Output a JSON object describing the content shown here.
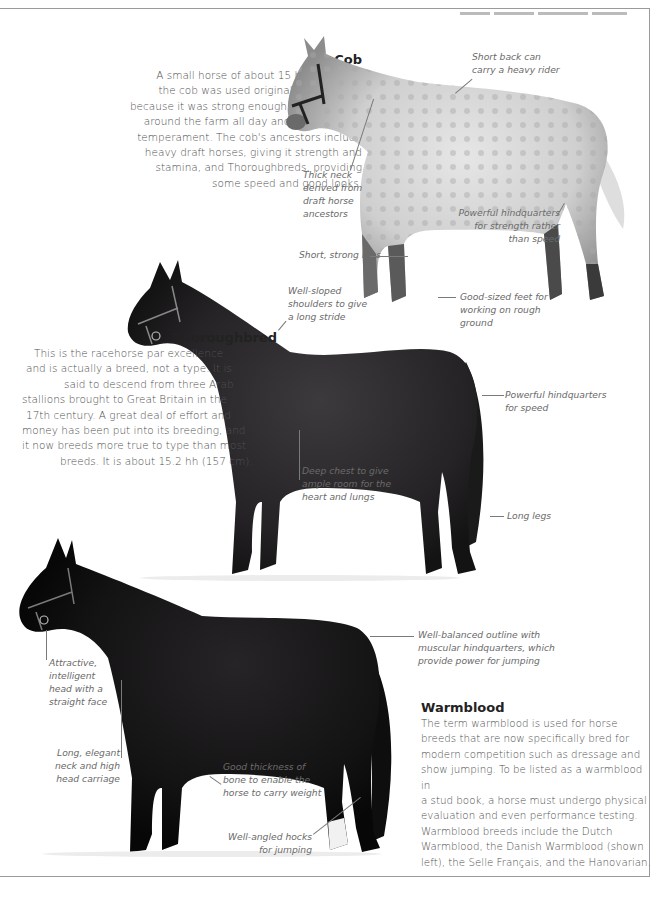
{
  "page": {
    "frame": {
      "border_color": "#9a9a9a",
      "background": "#ffffff"
    }
  },
  "breeds": {
    "cob": {
      "title": "Cob",
      "body_lines": [
        "A small horse of about 15 hh (152 cm),",
        "the cob was used originally by farmers",
        "because it was strong enough to carry them",
        "around the farm all day and had a steady",
        "temperament. The cob's ancestors include",
        "heavy draft horses, giving it strength and",
        "stamina, and Thoroughbreds, providing",
        "some speed and good looks."
      ],
      "coat": "dapple grey",
      "annotations": [
        {
          "lines": [
            "Short back can",
            "carry a heavy rider"
          ]
        },
        {
          "lines": [
            "Thick neck",
            "derived from",
            "draft horse",
            "ancestors"
          ]
        },
        {
          "lines": [
            "Powerful hindquarters",
            "for strength rather",
            "than speed"
          ]
        },
        {
          "lines": [
            "Short, strong legs"
          ]
        },
        {
          "lines": [
            "Good-sized feet for",
            "working on rough",
            "ground"
          ]
        }
      ]
    },
    "thoroughbred": {
      "title": "Thoroughbred",
      "body_lines": [
        "This is the racehorse par excellence",
        "and is actually a breed, not a type. It is",
        "said to descend from three Arab",
        "stallions brought to Great Britain in the",
        "17th century. A great deal of effort and",
        "money has been put into its breeding, and",
        "it now breeds more true to type than most",
        "breeds. It is about 15.2 hh (157 cm)."
      ],
      "coat": "dark bay",
      "annotations": [
        {
          "lines": [
            "Well-sloped",
            "shoulders to give",
            "a long stride"
          ]
        },
        {
          "lines": [
            "Powerful hindquarters",
            "for speed"
          ]
        },
        {
          "lines": [
            "Deep chest to give",
            "ample room for the",
            "heart and lungs"
          ]
        },
        {
          "lines": [
            "Long legs"
          ]
        }
      ]
    },
    "warmblood": {
      "title": "Warmblood",
      "body_lines": [
        "The term warmblood is used for horse",
        "breeds that are now specifically bred for",
        "modern competition such as dressage and",
        "show jumping. To be listed as a warmblood in",
        "a stud book, a horse must undergo physical",
        "evaluation and even performance testing.",
        "Warmblood breeds include the Dutch",
        "Warmblood, the Danish Warmblood (shown",
        "left), the Selle Français, and the Hanovarian."
      ],
      "coat": "black",
      "annotations": [
        {
          "lines": [
            "Well-balanced outline with",
            "muscular hindquarters, which",
            "provide power for jumping"
          ]
        },
        {
          "lines": [
            "Attractive,",
            "intelligent",
            "head with a",
            "straight face"
          ]
        },
        {
          "lines": [
            "Long, elegant",
            "neck and high",
            "head carriage"
          ]
        },
        {
          "lines": [
            "Good thickness of",
            "bone to enable the",
            "horse to carry weight"
          ]
        },
        {
          "lines": [
            "Well-angled hocks",
            "for jumping"
          ]
        }
      ]
    }
  }
}
